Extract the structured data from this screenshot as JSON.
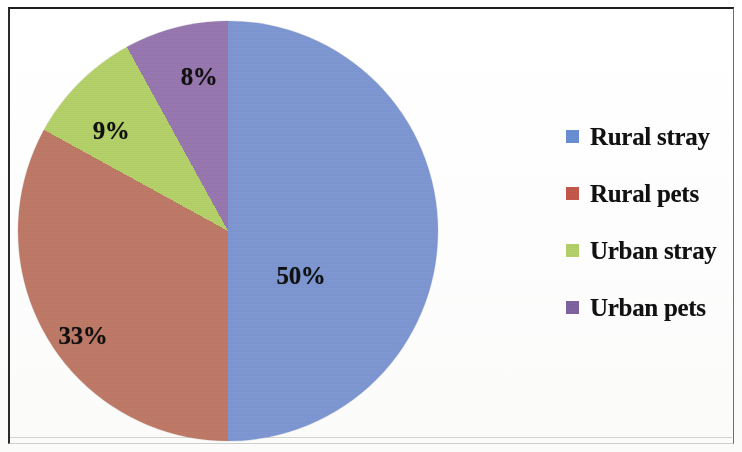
{
  "chart_data": {
    "type": "pie",
    "title": "",
    "categories": [
      "Rural stray",
      "Rural pets",
      "Urban stray",
      "Urban pets"
    ],
    "values": [
      50,
      33,
      9,
      8
    ],
    "value_labels": [
      "50%",
      "33%",
      "9%",
      "8%"
    ],
    "colors": [
      "#7f97d2",
      "#bf7a68",
      "#b5d26a",
      "#9878b0"
    ],
    "legend_position": "right",
    "grid": false,
    "start_angle_deg": 0,
    "direction": "clockwise",
    "units": "percent"
  },
  "legend": {
    "items": [
      {
        "label": "Rural stray",
        "color": "#6b8fd4"
      },
      {
        "label": "Rural pets",
        "color": "#c4594b"
      },
      {
        "label": "Urban stray",
        "color": "#b5d26a"
      },
      {
        "label": "Urban pets",
        "color": "#8064a2"
      }
    ]
  },
  "slice_labels": [
    {
      "text": "50%",
      "x": 283,
      "y": 255
    },
    {
      "text": "33%",
      "x": 65,
      "y": 315
    },
    {
      "text": "9%",
      "x": 93,
      "y": 110
    },
    {
      "text": "8%",
      "x": 181,
      "y": 56
    }
  ]
}
